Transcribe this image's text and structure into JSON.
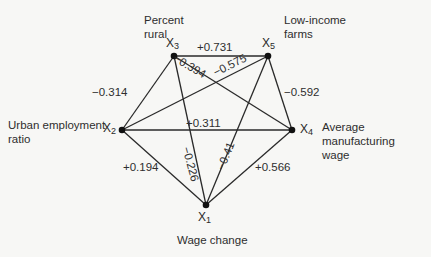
{
  "diagram": {
    "type": "correlation-graph",
    "nodes": [
      {
        "id": "X1",
        "symbol": "X",
        "sub": "1",
        "label": "Wage change",
        "x": 206,
        "y": 205
      },
      {
        "id": "X2",
        "symbol": "X",
        "sub": "2",
        "label": "Urban employment ratio",
        "x": 122,
        "y": 130
      },
      {
        "id": "X3",
        "symbol": "X",
        "sub": "3",
        "label": "Percent rural",
        "x": 174,
        "y": 56
      },
      {
        "id": "X4",
        "symbol": "X",
        "sub": "4",
        "label": "Average manufacturing wage",
        "x": 292,
        "y": 130
      },
      {
        "id": "X5",
        "symbol": "X",
        "sub": "5",
        "label": "Low-income farms",
        "x": 268,
        "y": 56
      }
    ],
    "edges": [
      {
        "from": "X3",
        "to": "X5",
        "value": "+0.731"
      },
      {
        "from": "X3",
        "to": "X4",
        "value": "−0.394"
      },
      {
        "from": "X5",
        "to": "X2",
        "value": "−0.575"
      },
      {
        "from": "X3",
        "to": "X2",
        "value": "−0.314"
      },
      {
        "from": "X5",
        "to": "X4",
        "value": "−0.592"
      },
      {
        "from": "X2",
        "to": "X4",
        "value": "+0.311"
      },
      {
        "from": "X2",
        "to": "X1",
        "value": "+0.194"
      },
      {
        "from": "X3",
        "to": "X1",
        "value": "−0.226"
      },
      {
        "from": "X5",
        "to": "X1",
        "value": "−0.41"
      },
      {
        "from": "X4",
        "to": "X1",
        "value": "+0.566"
      }
    ]
  },
  "labels": {
    "x3_line1": "Percent",
    "x3_line2": "rural",
    "x5_line1": "Low-income",
    "x5_line2": "farms",
    "x2_line1": "Urban employment",
    "x2_line2": "ratio",
    "x4_line1": "Average manufacturing",
    "x4_line2": "wage",
    "x1_line1": "Wage change"
  },
  "node_names": {
    "x1": {
      "sym": "X",
      "sub": "1"
    },
    "x2": {
      "sym": "X",
      "sub": "2"
    },
    "x3": {
      "sym": "X",
      "sub": "3"
    },
    "x4": {
      "sym": "X",
      "sub": "4"
    },
    "x5": {
      "sym": "X",
      "sub": "5"
    }
  },
  "edge_labels": {
    "x3_x5": "+0.731",
    "x3_x4": "−0.394",
    "x5_x2": "−0.575",
    "x3_x2": "−0.314",
    "x5_x4": "−0.592",
    "x2_x4": "+0.311",
    "x2_x1": "+0.194",
    "x3_x1": "−0.226",
    "x5_x1": "−0.41",
    "x4_x1": "+0.566"
  },
  "colors": {
    "background": "#f7f7f5",
    "line": "#2a2a2a",
    "node": "#111111"
  }
}
